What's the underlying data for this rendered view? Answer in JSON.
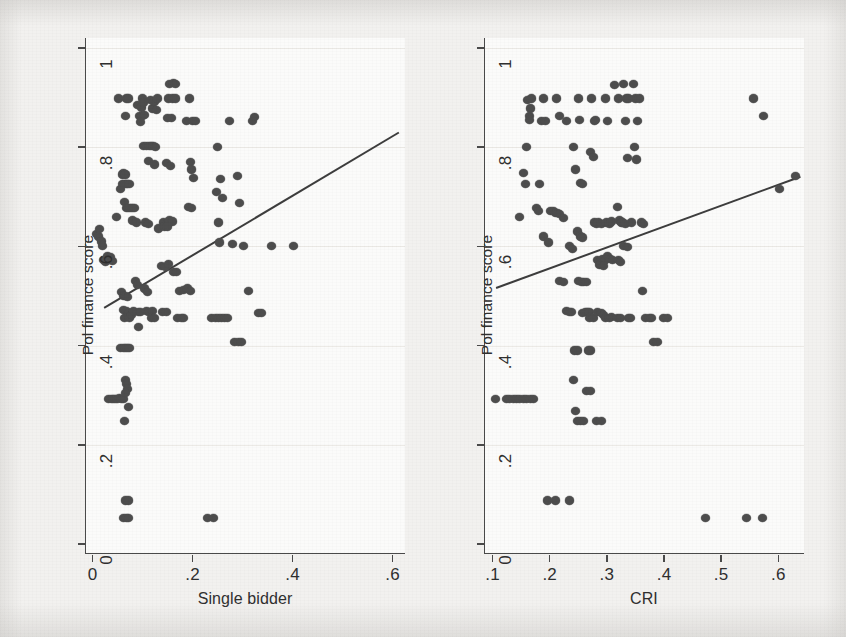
{
  "figure": {
    "background_color": "#f2f1ef",
    "plot_background_color": "#fbfbfa",
    "marker_color": "#4d4d4d",
    "axis_color": "#4a4a4a",
    "fitline_color": "#3d3d3d"
  },
  "chart_data": [
    {
      "type": "scatter",
      "panel": "left",
      "title": "",
      "xlabel": "Single bidder",
      "ylabel": "Pol finance score",
      "xlim": [
        -0.015,
        0.625
      ],
      "ylim": [
        -0.02,
        1.02
      ],
      "xticks": [
        0,
        0.2,
        0.4,
        0.6
      ],
      "xticklabels": [
        "0",
        ".2",
        ".4",
        ".6"
      ],
      "yticks": [
        0,
        0.2,
        0.4,
        0.6,
        0.8,
        1
      ],
      "yticklabels": [
        "0",
        ".2",
        ".4",
        ".6",
        ".8",
        "1"
      ],
      "grid": "faint-horizontal",
      "legend": "none",
      "fit_line": {
        "label": "linear fit",
        "x": [
          0.02,
          0.61
        ],
        "y": [
          0.478,
          0.832
        ]
      },
      "points": [
        [
          0.005,
          0.625
        ],
        [
          0.01,
          0.62
        ],
        [
          0.012,
          0.635
        ],
        [
          0.015,
          0.61
        ],
        [
          0.018,
          0.6
        ],
        [
          0.02,
          0.572
        ],
        [
          0.023,
          0.568
        ],
        [
          0.026,
          0.575
        ],
        [
          0.028,
          0.58
        ],
        [
          0.031,
          0.572
        ],
        [
          0.034,
          0.578
        ],
        [
          0.037,
          0.57
        ],
        [
          0.03,
          0.292
        ],
        [
          0.036,
          0.292
        ],
        [
          0.04,
          0.292
        ],
        [
          0.044,
          0.292
        ],
        [
          0.048,
          0.292
        ],
        [
          0.052,
          0.295
        ],
        [
          0.056,
          0.292
        ],
        [
          0.06,
          0.292
        ],
        [
          0.046,
          0.66
        ],
        [
          0.05,
          0.898
        ],
        [
          0.053,
          0.715
        ],
        [
          0.057,
          0.745
        ],
        [
          0.06,
          0.748
        ],
        [
          0.063,
          0.745
        ],
        [
          0.057,
          0.725
        ],
        [
          0.062,
          0.725
        ],
        [
          0.065,
          0.725
        ],
        [
          0.068,
          0.725
        ],
        [
          0.072,
          0.725
        ],
        [
          0.062,
          0.69
        ],
        [
          0.065,
          0.678
        ],
        [
          0.07,
          0.678
        ],
        [
          0.074,
          0.678
        ],
        [
          0.078,
          0.678
        ],
        [
          0.082,
          0.678
        ],
        [
          0.063,
          0.862
        ],
        [
          0.066,
          0.898
        ],
        [
          0.07,
          0.898
        ],
        [
          0.053,
          0.395
        ],
        [
          0.059,
          0.395
        ],
        [
          0.063,
          0.395
        ],
        [
          0.068,
          0.395
        ],
        [
          0.072,
          0.395
        ],
        [
          0.064,
          0.33
        ],
        [
          0.066,
          0.322
        ],
        [
          0.068,
          0.313
        ],
        [
          0.064,
          0.305
        ],
        [
          0.07,
          0.276
        ],
        [
          0.062,
          0.248
        ],
        [
          0.055,
          0.508
        ],
        [
          0.06,
          0.5
        ],
        [
          0.064,
          0.5
        ],
        [
          0.068,
          0.498
        ],
        [
          0.06,
          0.472
        ],
        [
          0.065,
          0.47
        ],
        [
          0.07,
          0.465
        ],
        [
          0.066,
          0.458
        ],
        [
          0.062,
          0.455
        ],
        [
          0.071,
          0.455
        ],
        [
          0.076,
          0.462
        ],
        [
          0.08,
          0.47
        ],
        [
          0.064,
          0.088
        ],
        [
          0.07,
          0.088
        ],
        [
          0.06,
          0.052
        ],
        [
          0.065,
          0.052
        ],
        [
          0.07,
          0.052
        ],
        [
          0.078,
          0.652
        ],
        [
          0.085,
          0.648
        ],
        [
          0.083,
          0.53
        ],
        [
          0.088,
          0.522
        ],
        [
          0.09,
          0.468
        ],
        [
          0.094,
          0.468
        ],
        [
          0.09,
          0.438
        ],
        [
          0.088,
          0.885
        ],
        [
          0.092,
          0.862
        ],
        [
          0.095,
          0.88
        ],
        [
          0.097,
          0.862
        ],
        [
          0.094,
          0.85
        ],
        [
          0.098,
          0.898
        ],
        [
          0.1,
          0.89
        ],
        [
          0.102,
          0.865
        ],
        [
          0.1,
          0.802
        ],
        [
          0.106,
          0.802
        ],
        [
          0.112,
          0.802
        ],
        [
          0.116,
          0.802
        ],
        [
          0.12,
          0.802
        ],
        [
          0.124,
          0.8
        ],
        [
          0.104,
          0.648
        ],
        [
          0.11,
          0.645
        ],
        [
          0.102,
          0.515
        ],
        [
          0.108,
          0.508
        ],
        [
          0.106,
          0.47
        ],
        [
          0.11,
          0.468
        ],
        [
          0.114,
          0.468
        ],
        [
          0.118,
          0.47
        ],
        [
          0.116,
          0.455
        ],
        [
          0.122,
          0.455
        ],
        [
          0.113,
          0.895
        ],
        [
          0.118,
          0.878
        ],
        [
          0.121,
          0.892
        ],
        [
          0.126,
          0.875
        ],
        [
          0.128,
          0.898
        ],
        [
          0.11,
          0.772
        ],
        [
          0.122,
          0.765
        ],
        [
          0.13,
          0.636
        ],
        [
          0.137,
          0.468
        ],
        [
          0.145,
          0.468
        ],
        [
          0.152,
          0.928
        ],
        [
          0.16,
          0.93
        ],
        [
          0.164,
          0.928
        ],
        [
          0.15,
          0.898
        ],
        [
          0.158,
          0.898
        ],
        [
          0.164,
          0.898
        ],
        [
          0.148,
          0.858
        ],
        [
          0.156,
          0.858
        ],
        [
          0.146,
          0.768
        ],
        [
          0.154,
          0.762
        ],
        [
          0.14,
          0.648
        ],
        [
          0.146,
          0.645
        ],
        [
          0.152,
          0.652
        ],
        [
          0.158,
          0.65
        ],
        [
          0.142,
          0.64
        ],
        [
          0.148,
          0.64
        ],
        [
          0.136,
          0.56
        ],
        [
          0.143,
          0.558
        ],
        [
          0.149,
          0.565
        ],
        [
          0.16,
          0.548
        ],
        [
          0.166,
          0.548
        ],
        [
          0.168,
          0.455
        ],
        [
          0.175,
          0.455
        ],
        [
          0.18,
          0.455
        ],
        [
          0.172,
          0.51
        ],
        [
          0.179,
          0.512
        ],
        [
          0.185,
          0.852
        ],
        [
          0.192,
          0.898
        ],
        [
          0.198,
          0.852
        ],
        [
          0.203,
          0.852
        ],
        [
          0.194,
          0.77
        ],
        [
          0.196,
          0.755
        ],
        [
          0.2,
          0.738
        ],
        [
          0.19,
          0.68
        ],
        [
          0.196,
          0.678
        ],
        [
          0.188,
          0.515
        ],
        [
          0.193,
          0.51
        ],
        [
          0.228,
          0.052
        ],
        [
          0.24,
          0.052
        ],
        [
          0.235,
          0.455
        ],
        [
          0.243,
          0.455
        ],
        [
          0.249,
          0.455
        ],
        [
          0.256,
          0.455
        ],
        [
          0.248,
          0.8
        ],
        [
          0.254,
          0.735
        ],
        [
          0.258,
          0.698
        ],
        [
          0.245,
          0.71
        ],
        [
          0.25,
          0.648
        ],
        [
          0.252,
          0.608
        ],
        [
          0.262,
          0.455
        ],
        [
          0.268,
          0.455
        ],
        [
          0.272,
          0.852
        ],
        [
          0.278,
          0.605
        ],
        [
          0.282,
          0.408
        ],
        [
          0.29,
          0.408
        ],
        [
          0.296,
          0.408
        ],
        [
          0.288,
          0.742
        ],
        [
          0.292,
          0.688
        ],
        [
          0.299,
          0.6
        ],
        [
          0.31,
          0.51
        ],
        [
          0.318,
          0.852
        ],
        [
          0.322,
          0.86
        ],
        [
          0.33,
          0.465
        ],
        [
          0.336,
          0.465
        ],
        [
          0.355,
          0.6
        ],
        [
          0.4,
          0.6
        ]
      ]
    },
    {
      "type": "scatter",
      "panel": "right",
      "title": "",
      "xlabel": "CRI",
      "ylabel": "Pol finance score",
      "xlim": [
        0.085,
        0.645
      ],
      "ylim": [
        -0.02,
        1.02
      ],
      "xticks": [
        0.1,
        0.2,
        0.3,
        0.4,
        0.5,
        0.6
      ],
      "xticklabels": [
        ".1",
        ".2",
        ".3",
        ".4",
        ".5",
        ".6"
      ],
      "yticks": [
        0,
        0.2,
        0.4,
        0.6,
        0.8,
        1
      ],
      "yticklabels": [
        "0",
        ".2",
        ".4",
        ".6",
        ".8",
        "1"
      ],
      "grid": "faint-horizontal",
      "legend": "none",
      "fit_line": {
        "label": "linear fit",
        "x": [
          0.105,
          0.637
        ],
        "y": [
          0.518,
          0.742
        ]
      },
      "points": [
        [
          0.103,
          0.292
        ],
        [
          0.122,
          0.292
        ],
        [
          0.128,
          0.292
        ],
        [
          0.134,
          0.292
        ],
        [
          0.14,
          0.292
        ],
        [
          0.146,
          0.292
        ],
        [
          0.152,
          0.292
        ],
        [
          0.158,
          0.292
        ],
        [
          0.164,
          0.292
        ],
        [
          0.17,
          0.292
        ],
        [
          0.145,
          0.66
        ],
        [
          0.152,
          0.748
        ],
        [
          0.155,
          0.725
        ],
        [
          0.16,
          0.895
        ],
        [
          0.162,
          0.862
        ],
        [
          0.165,
          0.878
        ],
        [
          0.163,
          0.855
        ],
        [
          0.167,
          0.898
        ],
        [
          0.158,
          0.8
        ],
        [
          0.175,
          0.678
        ],
        [
          0.178,
          0.672
        ],
        [
          0.18,
          0.725
        ],
        [
          0.183,
          0.852
        ],
        [
          0.187,
          0.898
        ],
        [
          0.19,
          0.852
        ],
        [
          0.194,
          0.088
        ],
        [
          0.208,
          0.088
        ],
        [
          0.232,
          0.088
        ],
        [
          0.188,
          0.62
        ],
        [
          0.196,
          0.608
        ],
        [
          0.2,
          0.672
        ],
        [
          0.205,
          0.672
        ],
        [
          0.21,
          0.898
        ],
        [
          0.215,
          0.862
        ],
        [
          0.208,
          0.668
        ],
        [
          0.212,
          0.668
        ],
        [
          0.216,
          0.665
        ],
        [
          0.222,
          0.658
        ],
        [
          0.228,
          0.852
        ],
        [
          0.215,
          0.53
        ],
        [
          0.222,
          0.528
        ],
        [
          0.228,
          0.47
        ],
        [
          0.232,
          0.468
        ],
        [
          0.236,
          0.468
        ],
        [
          0.232,
          0.6
        ],
        [
          0.238,
          0.595
        ],
        [
          0.24,
          0.33
        ],
        [
          0.242,
          0.39
        ],
        [
          0.246,
          0.39
        ],
        [
          0.244,
          0.268
        ],
        [
          0.247,
          0.248
        ],
        [
          0.252,
          0.248
        ],
        [
          0.258,
          0.248
        ],
        [
          0.24,
          0.8
        ],
        [
          0.244,
          0.755
        ],
        [
          0.248,
          0.898
        ],
        [
          0.25,
          0.855
        ],
        [
          0.252,
          0.728
        ],
        [
          0.256,
          0.725
        ],
        [
          0.247,
          0.63
        ],
        [
          0.252,
          0.62
        ],
        [
          0.256,
          0.618
        ],
        [
          0.248,
          0.53
        ],
        [
          0.254,
          0.528
        ],
        [
          0.258,
          0.528
        ],
        [
          0.262,
          0.528
        ],
        [
          0.256,
          0.465
        ],
        [
          0.26,
          0.468
        ],
        [
          0.264,
          0.468
        ],
        [
          0.268,
          0.468
        ],
        [
          0.262,
          0.308
        ],
        [
          0.27,
          0.308
        ],
        [
          0.266,
          0.39
        ],
        [
          0.27,
          0.39
        ],
        [
          0.268,
          0.455
        ],
        [
          0.274,
          0.455
        ],
        [
          0.272,
          0.898
        ],
        [
          0.276,
          0.852
        ],
        [
          0.278,
          0.855
        ],
        [
          0.27,
          0.79
        ],
        [
          0.274,
          0.78
        ],
        [
          0.276,
          0.648
        ],
        [
          0.28,
          0.645
        ],
        [
          0.284,
          0.648
        ],
        [
          0.288,
          0.645
        ],
        [
          0.282,
          0.572
        ],
        [
          0.286,
          0.568
        ],
        [
          0.29,
          0.575
        ],
        [
          0.294,
          0.57
        ],
        [
          0.286,
          0.562
        ],
        [
          0.292,
          0.56
        ],
        [
          0.282,
          0.468
        ],
        [
          0.288,
          0.465
        ],
        [
          0.292,
          0.462
        ],
        [
          0.28,
          0.248
        ],
        [
          0.288,
          0.248
        ],
        [
          0.296,
          0.898
        ],
        [
          0.3,
          0.852
        ],
        [
          0.298,
          0.648
        ],
        [
          0.302,
          0.645
        ],
        [
          0.306,
          0.65
        ],
        [
          0.3,
          0.58
        ],
        [
          0.304,
          0.575
        ],
        [
          0.308,
          0.572
        ],
        [
          0.296,
          0.455
        ],
        [
          0.302,
          0.455
        ],
        [
          0.306,
          0.458
        ],
        [
          0.312,
          0.925
        ],
        [
          0.318,
          0.898
        ],
        [
          0.316,
          0.68
        ],
        [
          0.32,
          0.652
        ],
        [
          0.324,
          0.648
        ],
        [
          0.318,
          0.572
        ],
        [
          0.322,
          0.568
        ],
        [
          0.316,
          0.455
        ],
        [
          0.322,
          0.455
        ],
        [
          0.328,
          0.928
        ],
        [
          0.332,
          0.898
        ],
        [
          0.336,
          0.898
        ],
        [
          0.33,
          0.852
        ],
        [
          0.334,
          0.778
        ],
        [
          0.326,
          0.648
        ],
        [
          0.33,
          0.645
        ],
        [
          0.328,
          0.6
        ],
        [
          0.334,
          0.598
        ],
        [
          0.336,
          0.455
        ],
        [
          0.34,
          0.455
        ],
        [
          0.344,
          0.928
        ],
        [
          0.348,
          0.898
        ],
        [
          0.346,
          0.8
        ],
        [
          0.35,
          0.775
        ],
        [
          0.342,
          0.648
        ],
        [
          0.352,
          0.852
        ],
        [
          0.356,
          0.898
        ],
        [
          0.358,
          0.648
        ],
        [
          0.362,
          0.645
        ],
        [
          0.36,
          0.51
        ],
        [
          0.366,
          0.455
        ],
        [
          0.372,
          0.455
        ],
        [
          0.376,
          0.455
        ],
        [
          0.38,
          0.408
        ],
        [
          0.386,
          0.408
        ],
        [
          0.398,
          0.455
        ],
        [
          0.404,
          0.455
        ],
        [
          0.47,
          0.052
        ],
        [
          0.542,
          0.052
        ],
        [
          0.57,
          0.052
        ],
        [
          0.555,
          0.898
        ],
        [
          0.572,
          0.862
        ],
        [
          0.6,
          0.715
        ],
        [
          0.628,
          0.742
        ]
      ]
    }
  ]
}
